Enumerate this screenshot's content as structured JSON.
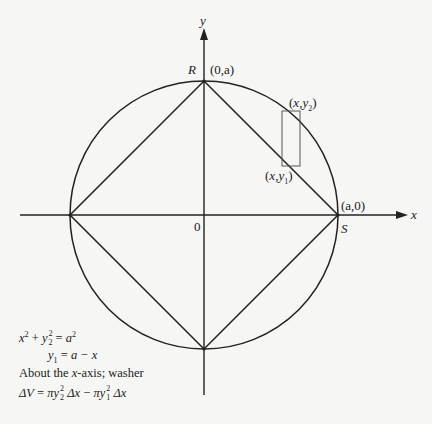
{
  "figure": {
    "type": "geometry-diagram",
    "axes": {
      "x_label": "x",
      "y_label": "y",
      "origin_label": "0"
    },
    "points": {
      "R": {
        "name": "R",
        "coord": "(0,a)"
      },
      "S": {
        "name": "S",
        "coord": "(a,0)"
      },
      "upper": "(x,y2)",
      "lower": "(x,y1)"
    },
    "shapes": [
      "circle of radius a centered at origin",
      "inscribed square (diamond) with vertices on axes",
      "vertical rectangular strip between line and circle"
    ],
    "colors": {
      "stroke": "#222222",
      "strip": "#555555",
      "background": "#f6f6f4"
    }
  },
  "equations": {
    "eq1": {
      "lhs_a": "x",
      "lhs_a_exp": "2",
      "plus": " + ",
      "lhs_b": "y",
      "lhs_b_exp": "2",
      "lhs_b_sub": "2",
      "eq": " = ",
      "rhs": "a",
      "rhs_exp": "2"
    },
    "eq2": {
      "lhs": "y",
      "lhs_sub": "1",
      "eq": " = ",
      "rhs": "a − x"
    },
    "line3": {
      "pre": "About the ",
      "var": "x",
      "post": "-axis; washer"
    },
    "eq4": {
      "dV": "ΔV",
      "eq": " = ",
      "t1": "πy",
      "t1_exp": "2",
      "t1_sub": "2",
      "t1_dx": " Δx",
      "minus": " − ",
      "t2": "πy",
      "t2_exp": "2",
      "t2_sub": "1",
      "t2_dx": " Δx"
    }
  }
}
